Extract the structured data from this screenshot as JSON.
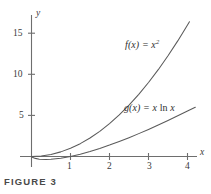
{
  "figure": {
    "caption": "FIGURE 3",
    "background_color": "#ffffff",
    "axis_color": "#6e6e6e",
    "curve_color": "#5a5a5a",
    "text_color": "#3a3a3a"
  },
  "chart_data": {
    "type": "line",
    "title": "",
    "subtitle": "",
    "xlabel": "x",
    "ylabel": "y",
    "xlim": [
      -0.3,
      4.25
    ],
    "ylim": [
      -1.5,
      18
    ],
    "grid": false,
    "legend": "inline-curve-labels",
    "xticks": [
      1,
      2,
      3,
      4
    ],
    "xtick_labels": [
      "1",
      "2",
      "3",
      "4"
    ],
    "yticks": [
      5,
      10,
      15
    ],
    "ytick_labels": [
      "5",
      "10",
      "15"
    ],
    "annotations": [
      {
        "text": "f(x) = x²",
        "x": 2.4,
        "y": 13.2
      },
      {
        "text": "g(x) = x ln x",
        "x": 2.4,
        "y": 5.5
      }
    ],
    "series": [
      {
        "name": "f(x) = x^2",
        "label_main": "f(x) = x",
        "label_exponent": "2",
        "color": "#5a5a5a",
        "x": [
          0,
          0.25,
          0.5,
          0.75,
          1,
          1.25,
          1.5,
          1.75,
          2,
          2.25,
          2.5,
          2.75,
          3,
          3.25,
          3.5,
          3.75,
          4.0,
          4.05
        ],
        "values": [
          0,
          0.0625,
          0.25,
          0.5625,
          1,
          1.5625,
          2.25,
          3.0625,
          4,
          5.0625,
          6.25,
          7.5625,
          9,
          10.5625,
          12.25,
          14.0625,
          16,
          16.4
        ]
      },
      {
        "name": "g(x) = x ln x",
        "label_prefix": "g(x) = x ",
        "label_ln": "ln",
        "label_suffix": " x",
        "color": "#5a5a5a",
        "x": [
          0.02,
          0.1,
          0.2,
          0.3679,
          0.5,
          0.75,
          1,
          1.25,
          1.5,
          1.75,
          2,
          2.25,
          2.5,
          2.75,
          3,
          3.25,
          3.5,
          3.75,
          4,
          4.2
        ],
        "values": [
          -0.078,
          -0.2303,
          -0.3219,
          -0.3679,
          -0.3466,
          -0.2158,
          0,
          0.2788,
          0.6082,
          0.9793,
          1.3863,
          1.8251,
          2.2907,
          2.7817,
          3.2958,
          3.8315,
          4.3874,
          4.9617,
          5.5452,
          5.9907
        ]
      }
    ]
  },
  "axes": {
    "y_axis_name": "y",
    "x_axis_name": "x",
    "ytick_15": "15",
    "ytick_10": "10",
    "ytick_5": "5",
    "xtick_1": "1",
    "xtick_2": "2",
    "xtick_3": "3",
    "xtick_4": "4"
  },
  "labels": {
    "f_prefix": "f(x) = x",
    "f_exponent": "2",
    "g_prefix": "g(x) = x ",
    "g_ln": "ln",
    "g_suffix": " x"
  }
}
